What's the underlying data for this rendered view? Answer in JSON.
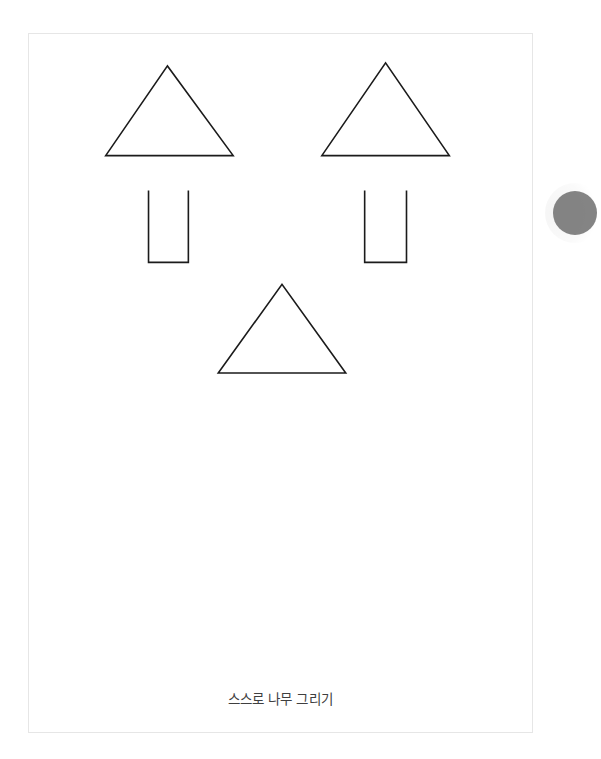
{
  "document": {
    "caption": "스스로 나무 그리기",
    "background_color": "#ffffff",
    "page_background_color": "#ffffff",
    "page_border_color": "#e6e6e6",
    "ink_color": "#1b1b1b",
    "caption_color": "#3f3f3f"
  },
  "drawing": {
    "title": "스스로 나무 그리기",
    "shapes": [
      {
        "name": "tree-canopy-left",
        "kind": "triangle",
        "points": "105,155 167,65 233,155",
        "apex_x": 167,
        "apex_y": 65,
        "base_y": 155,
        "base_left_x": 105,
        "base_right_x": 233
      },
      {
        "name": "tree-canopy-right",
        "kind": "triangle",
        "points": "322,155 386,62 450,155",
        "apex_x": 386,
        "apex_y": 62,
        "base_y": 155,
        "base_left_x": 322,
        "base_right_x": 450
      },
      {
        "name": "tree-trunk-left",
        "kind": "u-shape",
        "points": "148,190 148,262 188,262 188,190",
        "left_x": 148,
        "right_x": 188,
        "top_y": 190,
        "bottom_y": 262,
        "open_side": "top"
      },
      {
        "name": "tree-trunk-right",
        "kind": "u-shape",
        "points": "365,190 365,262 407,262 407,190",
        "left_x": 365,
        "right_x": 407,
        "top_y": 190,
        "bottom_y": 262,
        "open_side": "top"
      },
      {
        "name": "tree-canopy-bottom-center",
        "kind": "triangle",
        "points": "218,373 282,284 346,373",
        "apex_x": 282,
        "apex_y": 284,
        "base_y": 373,
        "base_left_x": 218,
        "base_right_x": 346
      }
    ]
  },
  "edge_control": {
    "name": "floating-round-button",
    "color": "#6f6f6f",
    "state": "partially-visible-clipped-at-right-edge"
  }
}
